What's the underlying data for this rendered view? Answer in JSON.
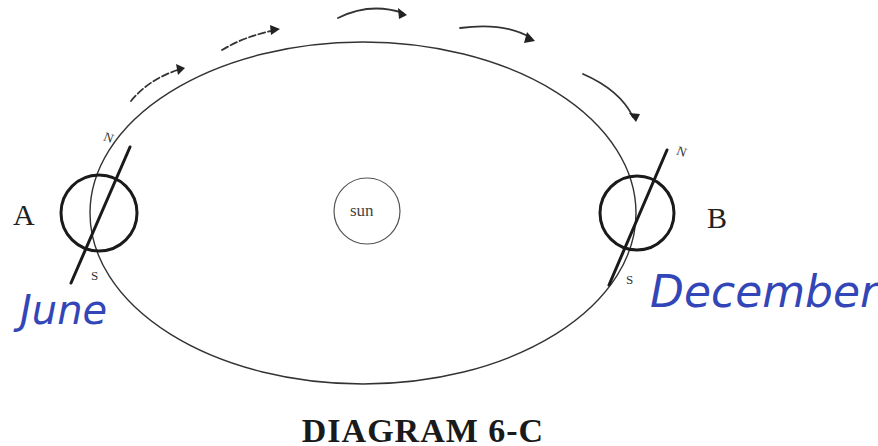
{
  "diagram": {
    "title": "DIAGRAM 6-C",
    "sun": {
      "label": "sun"
    },
    "positions": [
      {
        "id": "A",
        "label": "A",
        "north_label": "N",
        "south_label": "S",
        "annotation": "June"
      },
      {
        "id": "B",
        "label": "B",
        "north_label": "N",
        "south_label": "S",
        "annotation": "December"
      }
    ],
    "orbit_direction_arrows": 5,
    "colors": {
      "ink": "#222222",
      "handwriting": "#3346b8",
      "background": "#ffffff"
    }
  }
}
